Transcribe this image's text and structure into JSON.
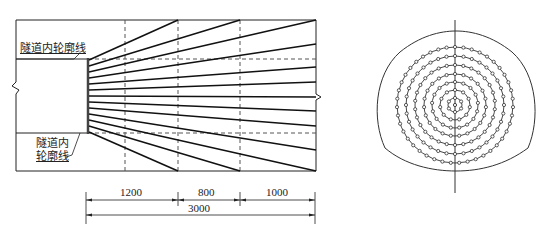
{
  "longitudinal_section": {
    "labels": {
      "upper_contour": "隧道内轮廓线",
      "lower_contour_line1": "隧道内",
      "lower_contour_line2": "轮廓线"
    },
    "dimensions": {
      "segment_1": "1200",
      "segment_2": "800",
      "segment_3": "1000",
      "total": "3000"
    },
    "bolt_count": 13
  },
  "cross_section": {
    "ring_count": 7,
    "ring_radii_px": [
      7,
      15,
      23,
      31,
      40,
      49,
      58
    ]
  },
  "colors": {
    "line": "#222222",
    "dashed": "#555555",
    "background": "#ffffff"
  }
}
